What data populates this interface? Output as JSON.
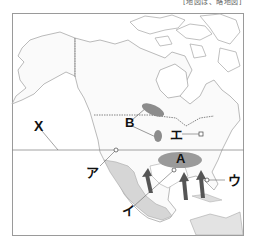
{
  "caption": "[地図は、略地図]",
  "map": {
    "region": "North America",
    "frame": {
      "x": 12,
      "y": 13,
      "width": 232,
      "height": 223,
      "stroke": "#999999"
    },
    "latitude_line": {
      "y": 150,
      "label": "X"
    },
    "colors": {
      "land_fill": "#fafafa",
      "coast": "#a8a8a8",
      "highlight_land": "#d6d6d6",
      "ellipse": "#8c8c8c",
      "arrow": "#555555"
    },
    "labels": [
      {
        "id": "X",
        "text": "X"
      },
      {
        "id": "A",
        "text": "A"
      },
      {
        "id": "B",
        "text": "B"
      },
      {
        "id": "a",
        "text": "ア"
      },
      {
        "id": "i",
        "text": "イ"
      },
      {
        "id": "u",
        "text": "ウ"
      },
      {
        "id": "e",
        "text": "エ"
      }
    ]
  }
}
